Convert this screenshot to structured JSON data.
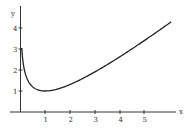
{
  "chart_data": {
    "type": "line",
    "title": "",
    "xlabel": "x",
    "ylabel": "y",
    "x_ticks": [
      "1",
      "2",
      "3",
      "4",
      "5"
    ],
    "y_ticks": [
      "1",
      "2",
      "3",
      "4"
    ],
    "xlim": [
      0,
      6.1
    ],
    "ylim": [
      0,
      4.5
    ],
    "grid": false,
    "legend": null,
    "series": [
      {
        "name": "y = x - ln(x)",
        "x": [
          0.05,
          0.1,
          0.2,
          0.3,
          0.5,
          0.7,
          1,
          1.5,
          2,
          2.5,
          3,
          3.5,
          4,
          4.5,
          5,
          5.5,
          6,
          6.1
        ],
        "values": [
          3.05,
          2.4,
          1.81,
          1.5,
          1.19,
          1.06,
          1.0,
          1.09,
          1.31,
          1.58,
          1.9,
          2.25,
          2.61,
          3.0,
          3.39,
          3.8,
          4.21,
          4.29
        ]
      }
    ]
  },
  "axes": {
    "x_label": "x",
    "y_label": "y"
  }
}
